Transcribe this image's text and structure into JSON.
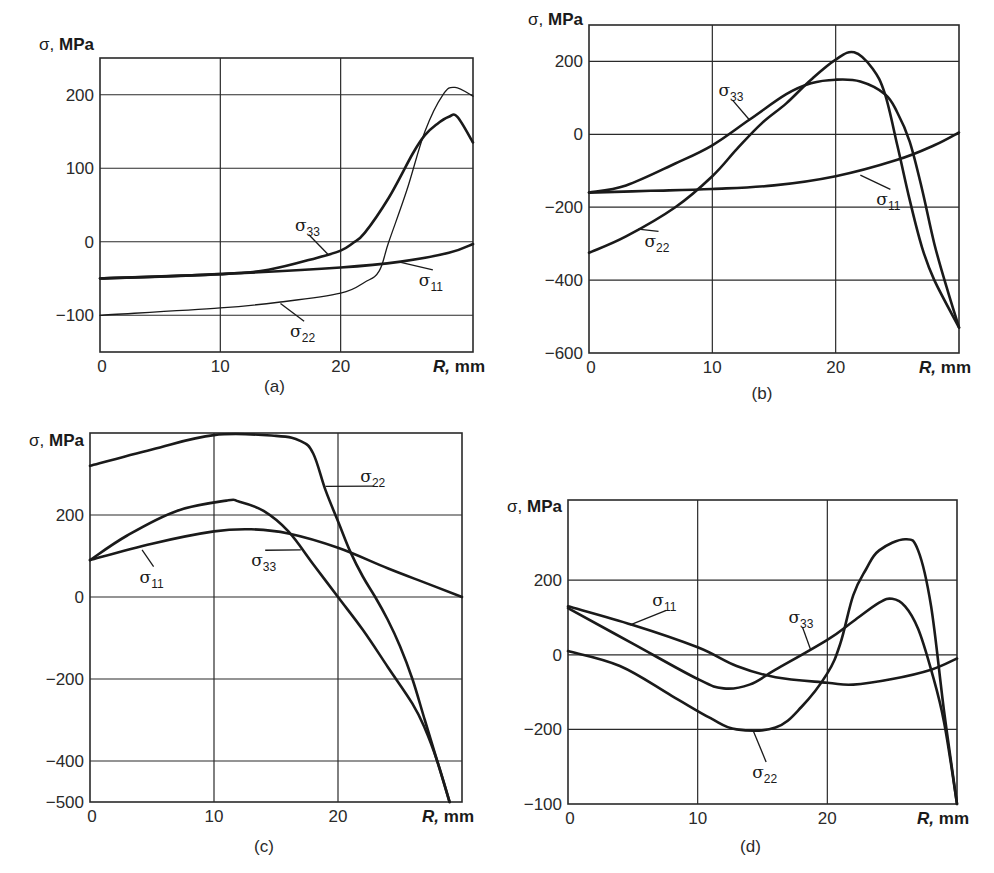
{
  "chart_data": [
    {
      "panel": "(a)",
      "type": "line",
      "ylabel_symbol": "σ,",
      "ylabel_unit": "MPa",
      "xlabel_symbol": "R,",
      "xlabel_unit": "mm",
      "xlim": [
        0,
        31
      ],
      "ylim": [
        -150,
        250
      ],
      "xticks": [
        {
          "value": 0,
          "label": "0"
        },
        {
          "value": 10,
          "label": "10"
        },
        {
          "value": 20,
          "label": "20"
        }
      ],
      "yticks": [
        {
          "value": 200,
          "label": "200"
        },
        {
          "value": 100,
          "label": "100"
        },
        {
          "value": 0,
          "label": "0"
        },
        {
          "value": -100,
          "label": "−100"
        }
      ],
      "grid": true,
      "series": [
        {
          "name": "σ11",
          "base": "σ",
          "sub": "11",
          "weight": "thick",
          "x": [
            0,
            10,
            20,
            25,
            29,
            31
          ],
          "y": [
            -50,
            -44,
            -35,
            -27,
            -15,
            -3
          ],
          "label_at": [
            26.5,
            -60
          ],
          "leader_to": [
            25,
            -28
          ]
        },
        {
          "name": "σ33",
          "base": "σ",
          "sub": "33",
          "weight": "thick",
          "x": [
            0,
            10,
            14,
            18,
            20,
            21,
            22,
            24,
            26,
            27,
            28,
            29,
            29.7,
            31
          ],
          "y": [
            -50,
            -44,
            -38,
            -22,
            -12,
            -2,
            12,
            60,
            120,
            145,
            160,
            170,
            170,
            135
          ],
          "label_at": [
            16.2,
            15
          ],
          "leader_to": [
            19,
            -18
          ]
        },
        {
          "name": "σ22",
          "base": "σ",
          "sub": "22",
          "weight": "thin",
          "x": [
            0,
            10,
            15,
            20,
            22,
            23.2,
            24,
            25.5,
            27,
            28.5,
            29.5,
            31
          ],
          "y": [
            -100,
            -90,
            -82,
            -70,
            -55,
            -40,
            0,
            70,
            150,
            200,
            210,
            198
          ],
          "label_at": [
            15.8,
            -130
          ],
          "leader_to": [
            15,
            -84
          ]
        }
      ]
    },
    {
      "panel": "(b)",
      "type": "line",
      "ylabel_symbol": "σ,",
      "ylabel_unit": "MPa",
      "xlabel_symbol": "R,",
      "xlabel_unit": "mm",
      "xlim": [
        0,
        30
      ],
      "ylim": [
        -600,
        300
      ],
      "xticks": [
        {
          "value": 0,
          "label": "0"
        },
        {
          "value": 10,
          "label": "10"
        },
        {
          "value": 20,
          "label": "20"
        }
      ],
      "yticks": [
        {
          "value": 200,
          "label": "200"
        },
        {
          "value": 0,
          "label": "0"
        },
        {
          "value": -200,
          "label": "−200"
        },
        {
          "value": -400,
          "label": "−400"
        },
        {
          "value": -600,
          "label": "−600"
        }
      ],
      "grid": true,
      "series": [
        {
          "name": "σ11",
          "base": "σ",
          "sub": "11",
          "weight": "thick",
          "x": [
            0,
            5,
            10,
            15,
            20,
            25,
            28,
            30
          ],
          "y": [
            -160,
            -155,
            -150,
            -140,
            -115,
            -70,
            -30,
            5
          ],
          "label_at": [
            23.3,
            -195
          ],
          "leader_to": [
            22,
            -112
          ]
        },
        {
          "name": "σ33",
          "base": "σ",
          "sub": "33",
          "weight": "thick",
          "x": [
            0,
            3,
            7,
            10,
            13,
            16,
            18,
            20,
            22,
            24,
            25,
            26,
            27,
            28,
            29,
            30
          ],
          "y": [
            -160,
            -140,
            -80,
            -30,
            40,
            110,
            140,
            150,
            145,
            110,
            60,
            -20,
            -150,
            -300,
            -420,
            -530
          ],
          "label_at": [
            10.5,
            105
          ],
          "leader_to": [
            13,
            40
          ]
        },
        {
          "name": "σ22",
          "base": "σ",
          "sub": "22",
          "weight": "thick",
          "x": [
            0,
            3,
            7,
            10,
            12,
            14,
            16,
            18,
            20,
            21.5,
            23,
            24,
            25,
            26,
            27,
            28,
            30
          ],
          "y": [
            -325,
            -280,
            -200,
            -115,
            -40,
            30,
            85,
            150,
            205,
            225,
            180,
            110,
            -30,
            -180,
            -310,
            -400,
            -530
          ],
          "label_at": [
            4.5,
            -310
          ],
          "leader_to": [
            4,
            -260
          ]
        }
      ]
    },
    {
      "panel": "(c)",
      "type": "line",
      "ylabel_symbol": "σ,",
      "ylabel_unit": "MPa",
      "xlabel_symbol": "R,",
      "xlabel_unit": "mm",
      "xlim": [
        0,
        30
      ],
      "ylim": [
        -500,
        400
      ],
      "xticks": [
        {
          "value": 0,
          "label": "0"
        },
        {
          "value": 10,
          "label": "10"
        },
        {
          "value": 20,
          "label": "20"
        }
      ],
      "yticks": [
        {
          "value": 200,
          "label": "200"
        },
        {
          "value": 0,
          "label": "0"
        },
        {
          "value": -200,
          "label": "−200"
        },
        {
          "value": -400,
          "label": "−400"
        },
        {
          "value": -500,
          "label": "−500"
        }
      ],
      "grid": true,
      "series": [
        {
          "name": "σ22",
          "base": "σ",
          "sub": "22",
          "weight": "thick",
          "x": [
            0,
            5,
            10,
            15,
            17,
            18,
            19,
            20,
            21,
            22,
            23,
            24,
            25,
            26,
            27,
            28,
            29
          ],
          "y": [
            320,
            360,
            395,
            393,
            380,
            350,
            260,
            185,
            110,
            50,
            0,
            -55,
            -120,
            -200,
            -300,
            -400,
            -500
          ],
          "label_at": [
            21.8,
            280
          ],
          "leader_to": [
            19,
            270
          ]
        },
        {
          "name": "σ33",
          "base": "σ",
          "sub": "33",
          "weight": "thick",
          "x": [
            0,
            3,
            7,
            11,
            12,
            14,
            16,
            18,
            20,
            22,
            24,
            26,
            27,
            28,
            29
          ],
          "y": [
            90,
            150,
            210,
            235,
            233,
            210,
            160,
            80,
            0,
            -80,
            -170,
            -260,
            -320,
            -400,
            -500
          ],
          "label_at": [
            13,
            75
          ],
          "leader_to": [
            17,
            115
          ]
        },
        {
          "name": "σ11",
          "base": "σ",
          "sub": "11",
          "weight": "thick",
          "x": [
            0,
            5,
            10,
            13,
            16,
            20,
            24,
            27,
            30
          ],
          "y": [
            90,
            130,
            160,
            165,
            155,
            120,
            70,
            35,
            0
          ],
          "label_at": [
            4,
            35
          ],
          "leader_to": [
            4.2,
            115
          ]
        }
      ]
    },
    {
      "panel": "(d)",
      "type": "line",
      "ylabel_symbol": "σ,",
      "ylabel_unit": "MPa",
      "xlabel_symbol": "R,",
      "xlabel_unit": "mm",
      "xlim": [
        0,
        30
      ],
      "ylim": [
        -400,
        415
      ],
      "xticks": [
        {
          "value": 0,
          "label": "0"
        },
        {
          "value": 10,
          "label": "10"
        },
        {
          "value": 20,
          "label": "20"
        }
      ],
      "yticks": [
        {
          "value": 200,
          "label": "200"
        },
        {
          "value": 0,
          "label": "0"
        },
        {
          "value": -200,
          "label": "−200"
        },
        {
          "value": -400,
          "label": "−100"
        }
      ],
      "grid": true,
      "series": [
        {
          "name": "σ11",
          "base": "σ",
          "sub": "11",
          "weight": "thick",
          "x": [
            0,
            5,
            10,
            13,
            16,
            20,
            22,
            25,
            28,
            30
          ],
          "y": [
            130,
            80,
            20,
            -30,
            -60,
            -75,
            -80,
            -65,
            -40,
            -10
          ],
          "label_at": [
            6.5,
            130
          ],
          "leader_to": [
            4.8,
            80
          ]
        },
        {
          "name": "σ33",
          "base": "σ",
          "sub": "33",
          "weight": "thick",
          "x": [
            0,
            5,
            10,
            12,
            14,
            16,
            20,
            22,
            24,
            25,
            26,
            27,
            28,
            29,
            30
          ],
          "y": [
            125,
            30,
            -65,
            -90,
            -80,
            -40,
            40,
            90,
            140,
            150,
            130,
            70,
            -40,
            -180,
            -400
          ],
          "label_at": [
            17,
            85
          ],
          "leader_to": [
            18.7,
            15
          ]
        },
        {
          "name": "σ22",
          "base": "σ",
          "sub": "22",
          "weight": "thick",
          "x": [
            0,
            4,
            8,
            11,
            13,
            16,
            18,
            20,
            21,
            22,
            23,
            24,
            26,
            27,
            28,
            29,
            30
          ],
          "y": [
            10,
            -30,
            -110,
            -170,
            -200,
            -195,
            -140,
            -50,
            30,
            160,
            230,
            280,
            310,
            280,
            130,
            -150,
            -400
          ],
          "label_at": [
            14.2,
            -330
          ],
          "leader_to": [
            14.3,
            -205
          ]
        }
      ]
    }
  ]
}
